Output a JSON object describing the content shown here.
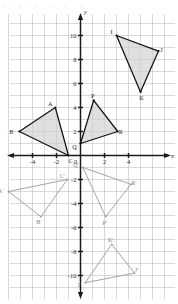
{
  "page": {
    "top_faint_text": "x  -  y  -  x  -  y  -  x  -  y",
    "background_color": "#ffffff",
    "grid_color": "#b9bfcc",
    "axis_color": "#1b1b1b",
    "solid_fill_color": "#cfcfcf",
    "light_stroke_color": "#9a9a9a"
  },
  "chart_data": {
    "type": "scatter",
    "title": "",
    "xlabel": "x",
    "ylabel": "y",
    "xlim": [
      -7,
      7
    ],
    "ylim": [
      -11.5,
      11.5
    ],
    "grid": true,
    "legend": "none",
    "x_ticks": [
      -4,
      -2,
      0,
      2,
      4
    ],
    "x_tick_labels": [
      "-4",
      "-2",
      "0",
      "2",
      "4"
    ],
    "y_ticks": [
      10,
      8,
      6,
      4,
      2,
      -2,
      -4,
      -6,
      -8,
      -10
    ],
    "y_tick_labels": [
      "10",
      "8",
      "6",
      "4",
      "2",
      "-2",
      "-4",
      "-6",
      "-8",
      "-10"
    ],
    "axis_label_x": "x",
    "axis_label_y": "y",
    "shapes": [
      {
        "name": "triangle-IJK",
        "style": "solid",
        "vertices": [
          {
            "label": "I",
            "x": 3.0,
            "y": 10.0,
            "label_dx": -5,
            "label_dy": -2
          },
          {
            "label": "J",
            "x": 6.5,
            "y": 8.7,
            "label_dx": 3,
            "label_dy": 1
          },
          {
            "label": "K",
            "x": 5.0,
            "y": 5.3,
            "label_dx": 1,
            "label_dy": 8
          }
        ]
      },
      {
        "name": "triangle-ABC",
        "style": "solid",
        "vertices": [
          {
            "label": "A",
            "x": -2.1,
            "y": 4.0,
            "label_dx": -5,
            "label_dy": -2
          },
          {
            "label": "B",
            "x": -5.1,
            "y": 2.0,
            "label_dx": -8,
            "label_dy": 2
          },
          {
            "label": "C",
            "x": -1.0,
            "y": 0.0,
            "label_dx": 2,
            "label_dy": 7
          }
        ]
      },
      {
        "name": "triangle-PQR",
        "style": "solid",
        "vertices": [
          {
            "label": "P",
            "x": 1.1,
            "y": 4.6,
            "label_dx": -1,
            "label_dy": -2
          },
          {
            "label": "Q",
            "x": 0.0,
            "y": 1.0,
            "label_dx": -6,
            "label_dy": 5
          },
          {
            "label": "R",
            "x": 3.1,
            "y": 2.0,
            "label_dx": 3,
            "label_dy": 2
          }
        ]
      },
      {
        "name": "triangle-A-B-C-prime",
        "style": "light",
        "vertices": [
          {
            "label": "A'",
            "x": -6.0,
            "y": -3.0,
            "label_dx": -8,
            "label_dy": 1
          },
          {
            "label": "B'",
            "x": -3.3,
            "y": -5.1,
            "label_dx": -2,
            "label_dy": 7
          },
          {
            "label": "C'",
            "x": -1.1,
            "y": -2.0,
            "label_dx": -5,
            "label_dy": -2
          }
        ]
      },
      {
        "name": "triangle-P-Q-R-prime",
        "style": "light",
        "vertices": [
          {
            "label": "Q'",
            "x": 0.2,
            "y": -1.0,
            "label_dx": -7,
            "label_dy": -1
          },
          {
            "label": "R'",
            "x": 4.2,
            "y": -2.4,
            "label_dx": 3,
            "label_dy": 1
          },
          {
            "label": "P'",
            "x": 2.1,
            "y": -5.1,
            "label_dx": -1,
            "label_dy": 8
          }
        ]
      },
      {
        "name": "triangle-I-J-K-prime",
        "style": "light",
        "vertices": [
          {
            "label": "I'",
            "x": 0.4,
            "y": -10.6,
            "label_dx": -6,
            "label_dy": 4
          },
          {
            "label": "J'",
            "x": 4.5,
            "y": -9.8,
            "label_dx": 2,
            "label_dy": -1
          },
          {
            "label": "K'",
            "x": 2.6,
            "y": -7.4,
            "label_dx": -1,
            "label_dy": -2
          }
        ]
      }
    ]
  }
}
